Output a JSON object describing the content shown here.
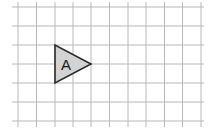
{
  "diagram": {
    "type": "grid-with-shape",
    "grid": {
      "columns": 10,
      "rows": 6,
      "cell_size_px": 18.3,
      "line_color": "#b8b8b8",
      "vertical_lines_x": [
        18,
        36.5,
        55,
        73,
        91,
        109.5,
        128,
        146,
        164.5,
        182.5,
        201
      ],
      "horizontal_lines_y": [
        7,
        26,
        45,
        64,
        83,
        102,
        121
      ]
    },
    "shape": {
      "kind": "triangle",
      "label": "A",
      "fill": "#d3d3d3",
      "stroke": "#2a2a2a",
      "vertices_grid": [
        [
          2,
          2
        ],
        [
          2,
          4
        ],
        [
          4,
          3
        ]
      ],
      "vertices_px": [
        [
          55,
          45
        ],
        [
          55,
          83
        ],
        [
          91,
          64
        ]
      ]
    }
  }
}
